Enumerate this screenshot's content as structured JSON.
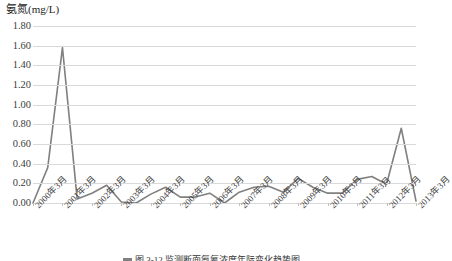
{
  "chart_data": {
    "type": "line",
    "title": "氨氮(mg/L)",
    "xlabel": "",
    "ylabel": "氨氮(mg/L)",
    "ylim": [
      0.0,
      1.8
    ],
    "ytick_labels": [
      "1.80",
      "1.60",
      "1.40",
      "1.20",
      "1.00",
      "0.80",
      "0.60",
      "0.40",
      "0.20",
      "0.00"
    ],
    "ytick_values": [
      1.8,
      1.6,
      1.4,
      1.2,
      1.0,
      0.8,
      0.6,
      0.4,
      0.2,
      0.0
    ],
    "grid": true,
    "legend_position": "bottom",
    "categories": [
      "2000年3月",
      "2001年3月",
      "2002年3月",
      "2003年3月",
      "2004年3月",
      "2005年3月",
      "2006年3月",
      "2007年3月",
      "2008年3月",
      "2009年3月",
      "2010年3月",
      "2011年3月",
      "2012年3月",
      "2013年3月"
    ],
    "series": [
      {
        "name": "氨氮",
        "color": "#808080",
        "x": [
          0,
          0.5,
          1,
          1.5,
          2,
          2.5,
          3,
          3.5,
          4,
          4.5,
          5,
          5.5,
          6,
          6.5,
          7,
          7.5,
          8,
          8.5,
          9,
          9.5,
          10,
          10.5,
          11,
          11.5,
          12,
          12.5,
          13
        ],
        "values": [
          0.0,
          0.36,
          1.58,
          0.04,
          0.1,
          0.18,
          0.01,
          0.0,
          0.09,
          0.16,
          0.06,
          0.06,
          0.1,
          0.0,
          0.11,
          0.16,
          0.17,
          0.11,
          0.25,
          0.16,
          0.1,
          0.1,
          0.24,
          0.27,
          0.19,
          0.76,
          0.02
        ]
      }
    ],
    "annotations": {
      "max_value": 1.58,
      "max_at": "2001年3月",
      "secondary_peak_value": 0.76,
      "secondary_peak_at": "2012年3月"
    }
  },
  "caption": {
    "legend_label": "氨氮",
    "text": "图 3-12   监测断面氨氮浓度年际变化趋势图"
  }
}
